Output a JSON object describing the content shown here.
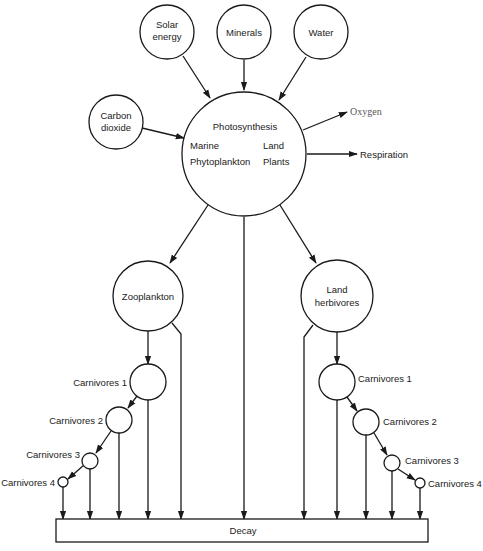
{
  "diagram": {
    "inputs": {
      "solar_energy": [
        "Solar",
        "energy"
      ],
      "minerals": "Minerals",
      "water": "Water",
      "carbon_dioxide": [
        "Carbon",
        "dioxide"
      ]
    },
    "center": {
      "title": "Photosynthesis",
      "left_line1": "Marine",
      "left_line2": "Phytoplankton",
      "right_line1": "Land",
      "right_line2": "Plants"
    },
    "outputs": {
      "oxygen": "Oxygen",
      "respiration": "Respiration"
    },
    "marine_chain": {
      "herbivore": "Zooplankton",
      "carnivores": [
        "Carnivores 1",
        "Carnivores 2",
        "Carnivores 3",
        "Carnivores 4"
      ]
    },
    "land_chain": {
      "herbivore": [
        "Land",
        "herbivores"
      ],
      "carnivores": [
        "Carnivores 1",
        "Carnivores 2",
        "Carnivores 3",
        "Carnivores 4"
      ]
    },
    "sink": "Decay",
    "colors": {
      "stroke": "#1a1a1a",
      "text": "#222222",
      "background": "#ffffff"
    }
  }
}
